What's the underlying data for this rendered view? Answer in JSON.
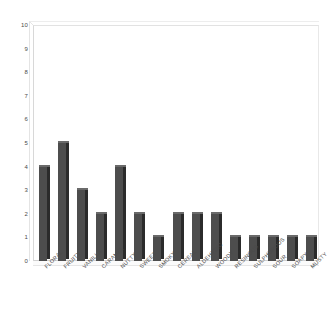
{
  "chart_data": {
    "type": "bar",
    "title": "",
    "subtitle": "",
    "xlabel": "",
    "ylabel": "",
    "ylim": [
      0,
      10
    ],
    "ytick_step": 1,
    "yticks": [
      "0",
      "1",
      "2",
      "3",
      "4",
      "5",
      "6",
      "7",
      "8",
      "9",
      "10"
    ],
    "grid": false,
    "legend": false,
    "legend_position": "none",
    "style": "3d-bar",
    "bar_color": "#4d4d4d",
    "bar_side_color": "#2b2b2b",
    "bar_top_color": "#6a6a6a",
    "background_color": "#ffffff",
    "axis_color": "#d8d8d8",
    "tick_label_color": "#4a4a4a",
    "categories": [
      "FLORAL",
      "FRUITY",
      "VANILLA",
      "CARAMEL",
      "NUTTY",
      "SWEET",
      "SMOKY",
      "CEREAL",
      "ALDEHYDIC",
      "WOODY",
      "RESINOUS",
      "SULPHUROUS",
      "SOUR",
      "SOAPY",
      "MUSTY"
    ],
    "values": [
      4,
      5,
      3,
      2,
      4,
      2,
      1,
      2,
      2,
      2,
      1,
      1,
      1,
      1,
      1
    ]
  }
}
